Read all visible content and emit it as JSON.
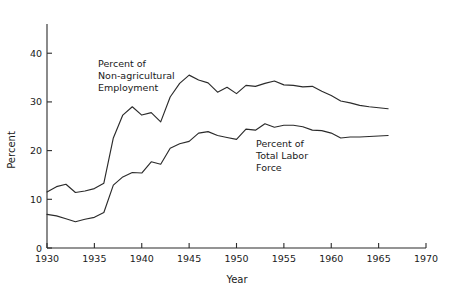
{
  "chart_data": {
    "type": "line",
    "title": "",
    "xlabel": "Year",
    "ylabel": "Percent",
    "xlim": [
      1930,
      1970
    ],
    "ylim": [
      0,
      46
    ],
    "grid": false,
    "legend": "inline-annotations",
    "xticks": [
      1930,
      1935,
      1940,
      1945,
      1950,
      1955,
      1960,
      1965,
      1970
    ],
    "xtick_labels": [
      "1930",
      "1935",
      "1940",
      "1945",
      "1950",
      "1955",
      "1960",
      "1965",
      "1970"
    ],
    "yticks": [
      0,
      10,
      20,
      30,
      40
    ],
    "ytick_labels": [
      "0",
      "10",
      "20",
      "30",
      "40"
    ],
    "x": [
      1930,
      1931,
      1932,
      1933,
      1934,
      1935,
      1936,
      1937,
      1938,
      1939,
      1940,
      1941,
      1942,
      1943,
      1944,
      1945,
      1946,
      1947,
      1948,
      1949,
      1950,
      1951,
      1952,
      1953,
      1954,
      1955,
      1956,
      1957,
      1958,
      1959,
      1960,
      1961,
      1962,
      1963,
      1964,
      1965,
      1966
    ],
    "series": [
      {
        "name": "Percent of Non-agricultural Employment",
        "annotation": "Percent of\nNon-agricultural\nEmployment",
        "color": "#2b2b2b",
        "values": [
          11.5,
          12.6,
          13.1,
          11.4,
          11.7,
          12.2,
          13.3,
          22.6,
          27.3,
          29.0,
          27.3,
          27.8,
          25.9,
          31.0,
          33.8,
          35.5,
          34.5,
          33.9,
          32.0,
          33.0,
          31.7,
          33.4,
          33.2,
          33.8,
          34.3,
          33.5,
          33.4,
          33.1,
          33.2,
          32.2,
          31.3,
          30.2,
          29.8,
          29.3,
          29.0,
          28.8,
          28.6
        ]
      },
      {
        "name": "Percent of Total Labor Force",
        "annotation": "Percent of\nTotal Labor\nForce",
        "color": "#2b2b2b",
        "values": [
          6.9,
          6.6,
          6.0,
          5.4,
          5.9,
          6.3,
          7.3,
          12.9,
          14.6,
          15.5,
          15.4,
          17.7,
          17.2,
          20.5,
          21.4,
          21.9,
          23.6,
          23.9,
          23.1,
          22.7,
          22.3,
          24.4,
          24.2,
          25.5,
          24.8,
          25.2,
          25.2,
          24.9,
          24.2,
          24.1,
          23.6,
          22.6,
          22.8,
          22.8,
          22.9,
          23.0,
          23.1
        ]
      }
    ]
  },
  "annotations": {
    "upper": {
      "line1": "Percent of",
      "line2": "Non-agricultural",
      "line3": "Employment"
    },
    "lower": {
      "line1": "Percent of",
      "line2": "Total Labor",
      "line3": "Force"
    }
  },
  "axes": {
    "y_title": "Percent",
    "x_title": "Year"
  }
}
